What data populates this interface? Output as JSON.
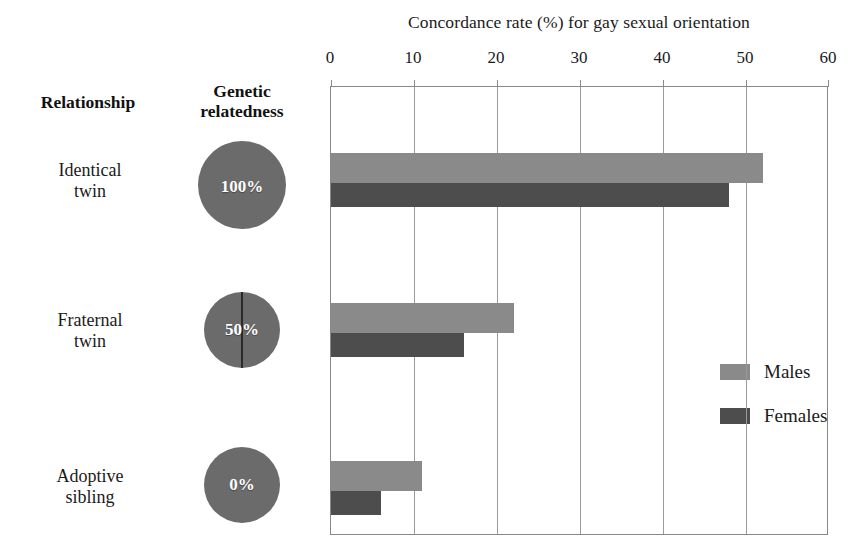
{
  "chart_data": {
    "type": "bar",
    "orientation": "horizontal",
    "title": "Concordance rate (%) for gay sexual orientation",
    "xlabel": "",
    "ylabel": "",
    "xlim": [
      0,
      60
    ],
    "xticks": [
      0,
      10,
      20,
      30,
      40,
      50,
      60
    ],
    "xtick_labels": [
      "0",
      "10",
      "20",
      "30",
      "40",
      "50",
      "60"
    ],
    "grid": true,
    "grid_axis": "x",
    "legend_position": "center-right inside plot",
    "categories": [
      "Identical twin",
      "Fraternal twin",
      "Adoptive sibling"
    ],
    "series": [
      {
        "name": "Males",
        "color": "#8a8a8a",
        "values": [
          52,
          22,
          11
        ]
      },
      {
        "name": "Females",
        "color": "#4d4d4d",
        "values": [
          48,
          16,
          6
        ]
      }
    ]
  },
  "table_columns": {
    "relationship": "Relationship",
    "relatedness": "Genetic\nrelatedness"
  },
  "rows": [
    {
      "relationship_line1": "Identical",
      "relationship_line2": "twin",
      "relatedness_pct": "100%",
      "relatedness_value": 100,
      "divided": false
    },
    {
      "relationship_line1": "Fraternal",
      "relationship_line2": "twin",
      "relatedness_pct": "50%",
      "relatedness_value": 50,
      "divided": true
    },
    {
      "relationship_line1": "Adoptive",
      "relationship_line2": "sibling",
      "relatedness_pct": "0%",
      "relatedness_value": 0,
      "divided": false
    }
  ],
  "legend": [
    {
      "label": "Males",
      "color": "#8a8a8a"
    },
    {
      "label": "Females",
      "color": "#4d4d4d"
    }
  ],
  "colors": {
    "males": "#8a8a8a",
    "females": "#4d4d4d",
    "circle": "#6b6b6b",
    "frame": "#888888",
    "gridline": "#9a9a9a",
    "text": "#1a1a1a"
  }
}
